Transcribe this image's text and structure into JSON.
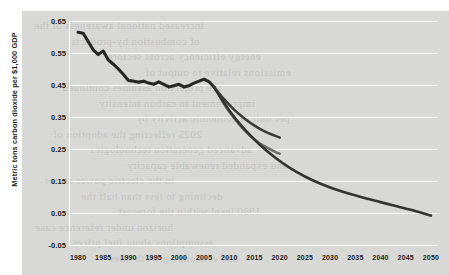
{
  "chart_data": {
    "type": "line",
    "title": "",
    "xlabel": "",
    "ylabel": "Metric tons carbon dioxide per $1,000 GDP",
    "xlim": [
      1978,
      2051
    ],
    "ylim": [
      -0.05,
      0.65
    ],
    "grid": true,
    "legend_position": "none",
    "xticks": [
      "1980",
      "1985",
      "1990",
      "1995",
      "2000",
      "2005",
      "2010",
      "2015",
      "2020",
      "2025",
      "2030",
      "2035",
      "2040",
      "2045",
      "2050"
    ],
    "yticks": [
      "0.65",
      "0.55",
      "0.45",
      "0.35",
      "0.25",
      "0.15",
      "0.05",
      "-0.05"
    ],
    "series": [
      {
        "name": "History",
        "color": "#262626",
        "x": [
          1980,
          1981,
          1982,
          1983,
          1984,
          1985,
          1986,
          1987,
          1988,
          1989,
          1990,
          1991,
          1992,
          1993,
          1994,
          1995,
          1996,
          1997,
          1998,
          1999,
          2000,
          2001,
          2002,
          2003,
          2004,
          2005,
          2006,
          2007
        ],
        "values": [
          0.615,
          0.612,
          0.586,
          0.56,
          0.545,
          0.556,
          0.528,
          0.515,
          0.5,
          0.483,
          0.464,
          0.462,
          0.459,
          0.462,
          0.456,
          0.452,
          0.46,
          0.452,
          0.444,
          0.448,
          0.452,
          0.444,
          0.448,
          0.456,
          0.462,
          0.468,
          0.46,
          0.443
        ]
      },
      {
        "name": "Projection high",
        "color": "#3a3a3a",
        "x": [
          2007,
          2009,
          2011,
          2013,
          2015,
          2017,
          2019,
          2020
        ],
        "values": [
          0.443,
          0.405,
          0.372,
          0.345,
          0.323,
          0.305,
          0.292,
          0.286
        ]
      },
      {
        "name": "Projection middle",
        "color": "#6d6d6d",
        "x": [
          2007,
          2009,
          2011,
          2013,
          2015,
          2017,
          2019,
          2020
        ],
        "values": [
          0.443,
          0.39,
          0.345,
          0.308,
          0.28,
          0.258,
          0.242,
          0.235
        ]
      },
      {
        "name": "Projection low",
        "color": "#333333",
        "x": [
          2007,
          2010,
          2013,
          2016,
          2019,
          2022,
          2025,
          2028,
          2031,
          2034,
          2037,
          2040,
          2043,
          2046,
          2050
        ],
        "values": [
          0.443,
          0.37,
          0.312,
          0.264,
          0.224,
          0.191,
          0.164,
          0.142,
          0.124,
          0.109,
          0.096,
          0.084,
          0.072,
          0.06,
          0.042
        ]
      }
    ]
  },
  "ghost_text": [
    "increased national awareness of the",
    "of combustion by-products",
    "energy efficiency across sectors",
    "emissions relative to output of",
    "the projection assumes continued",
    "improvement in carbon intensity",
    "per unit of economic activity by",
    "2025 reflecting the adoption of",
    "advanced generation technologies",
    "and expanded renewable capacity",
    "in the electric power sector",
    "declining to less than half the",
    "1980 level within the forecast",
    "horizon under reference case",
    "assumptions about fuel prices",
    "and economic growth rates"
  ]
}
